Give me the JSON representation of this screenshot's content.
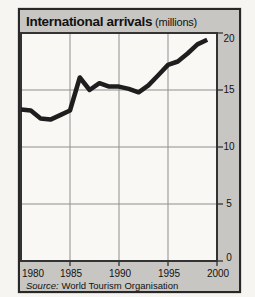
{
  "panel": {
    "title": "International arrivals",
    "title_suffix": " (millions)",
    "source_prefix": "Source:",
    "source_rest": " World Tourism Organisation"
  },
  "colors": {
    "page_bg": "#f6f5f2",
    "panel_bg": "#c7c6c3",
    "frame": "#282828",
    "plot_bg": "#f9f8f5",
    "grid": "#8f8f8f",
    "axis": "#333333",
    "line": "#1e1e1e",
    "text": "#121212"
  },
  "chart_data": {
    "type": "line",
    "title": "International arrivals",
    "subtitle": "(millions)",
    "source": "World Tourism Organisation",
    "xlabel": "",
    "ylabel": "millions",
    "xlim": [
      1980,
      2000
    ],
    "ylim": [
      0,
      20
    ],
    "grid": true,
    "legend": "none",
    "x_ticks": [
      1980,
      1985,
      1990,
      1995,
      2000
    ],
    "x_tick_labels": [
      "1980",
      "1985",
      "1990",
      "1995",
      "2000"
    ],
    "y_ticks": [
      0,
      5,
      10,
      15,
      20
    ],
    "y_tick_labels": [
      "20",
      "15",
      "10",
      "5",
      "0"
    ],
    "x": [
      1980,
      1981,
      1982,
      1983,
      1984,
      1985,
      1986,
      1987,
      1988,
      1989,
      1990,
      1991,
      1992,
      1993,
      1994,
      1995,
      1996,
      1997,
      1998,
      1999
    ],
    "values": [
      13.3,
      13.2,
      12.5,
      12.4,
      12.8,
      13.2,
      16.1,
      15.0,
      15.6,
      15.3,
      15.3,
      15.1,
      14.8,
      15.4,
      16.3,
      17.2,
      17.5,
      18.2,
      19.0,
      19.4
    ],
    "series": [
      {
        "name": "International arrivals (millions)",
        "values": [
          13.3,
          13.2,
          12.5,
          12.4,
          12.8,
          13.2,
          16.1,
          15.0,
          15.6,
          15.3,
          15.3,
          15.1,
          14.8,
          15.4,
          16.3,
          17.2,
          17.5,
          18.2,
          19.0,
          19.4
        ]
      }
    ],
    "line_width": 4.5
  }
}
